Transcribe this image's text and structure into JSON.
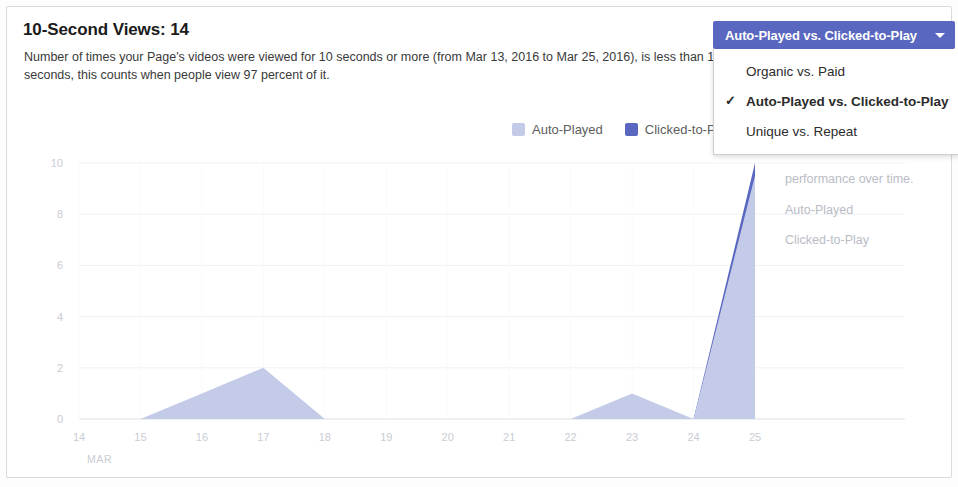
{
  "header": {
    "title": "10-Second Views: 14",
    "description": "Number of times your Page's videos were viewed for 10 seconds or more (from Mar 13, 2016 to Mar 25, 2016), is less than 10 seconds, this counts when people view 97 percent of it."
  },
  "dropdown": {
    "button_label": "Auto-Played vs. Clicked-to-Play",
    "caret_icon": "chevron-down-icon",
    "check_glyph": "✓",
    "options": [
      {
        "label": "Organic vs. Paid",
        "selected": false
      },
      {
        "label": "Auto-Played vs. Clicked-to-Play",
        "selected": true
      },
      {
        "label": "Unique vs. Repeat",
        "selected": false
      }
    ]
  },
  "ghost_panel": {
    "line1": "Compare your average",
    "line2": "performance over time.",
    "item1": "Auto-Played",
    "item2": "Clicked-to-Play"
  },
  "legend": {
    "items": [
      {
        "label": "Auto-Played",
        "color": "#c3cbe8"
      },
      {
        "label": "Clicked-to-Play",
        "color": "#5a67c0"
      }
    ]
  },
  "colors": {
    "accent": "#5a67c0",
    "series_light": "#c3cbe8",
    "series_dark": "#5a67c0",
    "axis_text": "#c9ccd4",
    "card_border": "#d8dade"
  },
  "chart_data": {
    "type": "area",
    "title": "10-Second Views: 14",
    "xlabel": "MAR",
    "ylabel": "",
    "x": [
      14,
      15,
      16,
      17,
      18,
      19,
      20,
      21,
      22,
      23,
      24,
      25
    ],
    "xtick_labels": [
      "14",
      "15",
      "16",
      "17",
      "18",
      "19",
      "20",
      "21",
      "22",
      "23",
      "24",
      "25"
    ],
    "ytick_labels": [
      "0",
      "2",
      "4",
      "6",
      "8",
      "10"
    ],
    "ylim": [
      0,
      10
    ],
    "grid": true,
    "legend_position": "top-right",
    "month_label": "MAR",
    "series": [
      {
        "name": "Auto-Played",
        "color": "#c3cbe8",
        "values": [
          0,
          0,
          1,
          2,
          0,
          0,
          0,
          0,
          0,
          1,
          0,
          9.5
        ]
      },
      {
        "name": "Clicked-to-Play",
        "color": "#5a67c0",
        "values": [
          0,
          0,
          0,
          0,
          0,
          0,
          0,
          0,
          0,
          0,
          0,
          10
        ]
      }
    ]
  }
}
